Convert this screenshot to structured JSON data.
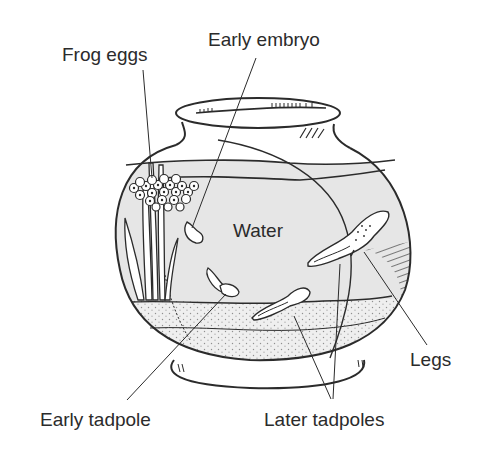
{
  "diagram": {
    "colors": {
      "ink": "#2b2b2b",
      "water": "#e6e6e6",
      "background": "#ffffff",
      "gravel_dots": "#555555"
    },
    "labels": {
      "frog_eggs": "Frog eggs",
      "early_embryo": "Early embryo",
      "water": "Water",
      "legs": "Legs",
      "early_tadpole": "Early tadpole",
      "later_tadpoles": "Later tadpoles"
    }
  }
}
